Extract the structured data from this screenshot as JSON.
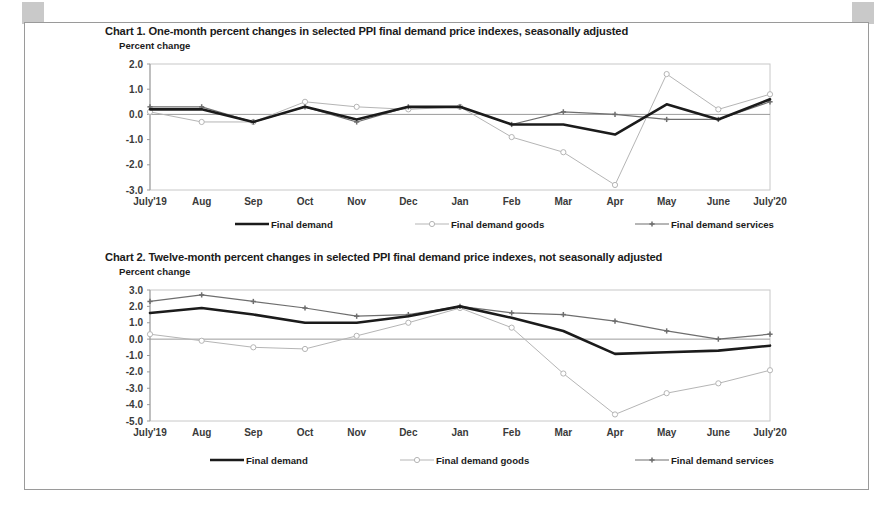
{
  "document": {
    "frame_border_color": "#9a9a9a",
    "corner_mark_color": "#c9c9c9"
  },
  "series_colors": {
    "final_demand": "#1b1b1b",
    "final_demand_goods": "#b5b5b5",
    "final_demand_services": "#6e6e6e"
  },
  "chart_data": [
    {
      "id": "chart1",
      "type": "line",
      "title": "Chart 1. One-month percent changes in selected PPI final demand price indexes, seasonally adjusted",
      "ylabel": "Percent change",
      "xlabel": "",
      "categories": [
        "July'19",
        "Aug",
        "Sep",
        "Oct",
        "Nov",
        "Dec",
        "Jan",
        "Feb",
        "Mar",
        "Apr",
        "May",
        "June",
        "July'20"
      ],
      "yticks": [
        "2.0",
        "1.0",
        "0.0",
        "-1.0",
        "-2.0",
        "-3.0"
      ],
      "ylim": [
        -3.0,
        2.0
      ],
      "grid": false,
      "legend_position": "bottom",
      "series": [
        {
          "name": "Final demand",
          "color": "#1b1b1b",
          "marker": "none",
          "width": 2.6,
          "values": [
            0.2,
            0.2,
            -0.3,
            0.3,
            -0.2,
            0.3,
            0.3,
            -0.4,
            -0.4,
            -0.8,
            0.4,
            -0.2,
            0.6
          ]
        },
        {
          "name": "Final demand goods",
          "color": "#b5b5b5",
          "marker": "circle",
          "width": 1.0,
          "values": [
            0.1,
            -0.3,
            -0.3,
            0.5,
            0.3,
            0.2,
            0.3,
            -0.9,
            -1.5,
            -2.8,
            1.6,
            0.2,
            0.8
          ]
        },
        {
          "name": "Final demand services",
          "color": "#6e6e6e",
          "marker": "plus",
          "width": 1.2,
          "values": [
            0.3,
            0.3,
            -0.3,
            0.3,
            -0.3,
            0.3,
            0.3,
            -0.4,
            0.1,
            0.0,
            -0.2,
            -0.2,
            0.5
          ]
        }
      ]
    },
    {
      "id": "chart2",
      "type": "line",
      "title": "Chart 2. Twelve-month percent changes in selected PPI final demand price indexes, not seasonally adjusted",
      "ylabel": "Percent change",
      "xlabel": "",
      "categories": [
        "July'19",
        "Aug",
        "Sep",
        "Oct",
        "Nov",
        "Dec",
        "Jan",
        "Feb",
        "Mar",
        "Apr",
        "May",
        "June",
        "July'20"
      ],
      "yticks": [
        "3.0",
        "2.0",
        "1.0",
        "0.0",
        "-1.0",
        "-2.0",
        "-3.0",
        "-4.0",
        "-5.0"
      ],
      "ylim": [
        -5.0,
        3.0
      ],
      "grid": false,
      "legend_position": "bottom",
      "series": [
        {
          "name": "Final demand",
          "color": "#1b1b1b",
          "marker": "none",
          "width": 2.6,
          "values": [
            1.6,
            1.9,
            1.5,
            1.0,
            1.0,
            1.4,
            2.0,
            1.3,
            0.5,
            -0.9,
            -0.8,
            -0.7,
            -0.4
          ]
        },
        {
          "name": "Final demand goods",
          "color": "#b5b5b5",
          "marker": "circle",
          "width": 1.0,
          "values": [
            0.3,
            -0.1,
            -0.5,
            -0.6,
            0.2,
            1.0,
            1.9,
            0.7,
            -2.1,
            -4.6,
            -3.3,
            -2.7,
            -1.9
          ]
        },
        {
          "name": "Final demand services",
          "color": "#6e6e6e",
          "marker": "plus",
          "width": 1.2,
          "values": [
            2.3,
            2.7,
            2.3,
            1.9,
            1.4,
            1.5,
            2.0,
            1.6,
            1.5,
            1.1,
            0.5,
            0.0,
            0.3
          ]
        }
      ]
    }
  ]
}
